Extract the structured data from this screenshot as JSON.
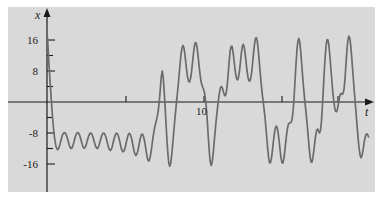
{
  "figure": {
    "background_color": "#ffffff",
    "plot_background_color": "#d9d9d9",
    "curve_color": "#6b6b6b",
    "axis_color": "#1a1a1a"
  },
  "axes": {
    "x_axis_label": "t",
    "y_axis_label": "x",
    "x_tick_labels": [
      "10"
    ],
    "y_tick_labels": [
      "16",
      "8",
      "-8",
      "-16"
    ]
  },
  "chart_data": {
    "type": "line",
    "title": "",
    "subtitle": "",
    "xlabel": "t",
    "ylabel": "x",
    "xlim": [
      0,
      20.6
    ],
    "ylim": [
      -19.5,
      18.5
    ],
    "grid": false,
    "legend_position": "none",
    "xticks": [
      5,
      10,
      15,
      20
    ],
    "xtick_labels": [
      "",
      "10",
      "",
      ""
    ],
    "yticks": [
      -16,
      -12,
      -8,
      -4,
      0,
      4,
      8,
      12,
      16
    ],
    "ytick_labels": [
      "-16",
      "",
      "-8",
      "",
      "",
      "",
      "8",
      "",
      "16"
    ],
    "series": [
      {
        "name": "x(t)",
        "color": "#6b6b6b",
        "x": [
          0.0,
          0.04,
          0.08,
          0.12,
          0.16,
          0.2,
          0.24,
          0.28,
          0.32,
          0.36,
          0.4,
          0.45,
          0.5,
          0.56,
          0.62,
          0.68,
          0.74,
          0.8,
          0.86,
          0.92,
          0.98,
          1.04,
          1.1,
          1.16,
          1.22,
          1.28,
          1.34,
          1.4,
          1.46,
          1.52,
          1.58,
          1.64,
          1.7,
          1.76,
          1.82,
          1.88,
          1.94,
          2.0,
          2.06,
          2.12,
          2.18,
          2.24,
          2.3,
          2.36,
          2.42,
          2.48,
          2.54,
          2.6,
          2.66,
          2.72,
          2.78,
          2.84,
          2.9,
          2.96,
          3.02,
          3.08,
          3.14,
          3.2,
          3.26,
          3.32,
          3.38,
          3.44,
          3.5,
          3.56,
          3.62,
          3.68,
          3.74,
          3.8,
          3.86,
          3.92,
          3.98,
          4.04,
          4.1,
          4.16,
          4.22,
          4.28,
          4.34,
          4.4,
          4.46,
          4.52,
          4.58,
          4.64,
          4.7,
          4.76,
          4.82,
          4.88,
          4.94,
          5.0,
          5.06,
          5.12,
          5.18,
          5.24,
          5.3,
          5.36,
          5.42,
          5.48,
          5.54,
          5.6,
          5.66,
          5.72,
          5.78,
          5.84,
          5.9,
          5.96,
          6.02,
          6.08,
          6.14,
          6.2,
          6.26,
          6.32,
          6.38,
          6.44,
          6.5,
          6.56,
          6.62,
          6.68,
          6.74,
          6.8,
          6.86,
          6.92,
          6.98,
          7.04,
          7.1,
          7.16,
          7.22,
          7.28,
          7.34,
          7.4,
          7.46,
          7.52,
          7.58,
          7.64,
          7.7,
          7.76,
          7.82,
          7.88,
          7.94,
          8.0,
          8.06,
          8.12,
          8.18,
          8.24,
          8.3,
          8.36,
          8.42,
          8.48,
          8.54,
          8.6,
          8.66,
          8.72,
          8.78,
          8.84,
          8.9,
          8.96,
          9.02,
          9.08,
          9.14,
          9.2,
          9.26,
          9.32,
          9.38,
          9.44,
          9.5,
          9.56,
          9.62,
          9.68,
          9.74,
          9.8,
          9.86,
          9.92,
          9.98,
          10.04,
          10.1,
          10.16,
          10.22,
          10.28,
          10.34,
          10.4,
          10.46,
          10.52,
          10.58,
          10.64,
          10.7,
          10.76,
          10.82,
          10.88,
          10.94,
          11.0,
          11.06,
          11.12,
          11.18,
          11.24,
          11.3,
          11.36,
          11.42,
          11.48,
          11.54,
          11.6,
          11.66,
          11.72,
          11.78,
          11.84,
          11.9,
          11.96,
          12.02,
          12.08,
          12.14,
          12.2,
          12.26,
          12.32,
          12.38,
          12.44,
          12.5,
          12.56,
          12.62,
          12.68,
          12.74,
          12.8,
          12.86,
          12.92,
          12.98,
          13.04,
          13.1,
          13.16,
          13.22,
          13.28,
          13.34,
          13.4,
          13.46,
          13.52,
          13.58,
          13.64,
          13.7,
          13.76,
          13.82,
          13.88,
          13.94,
          14.0,
          14.06,
          14.12,
          14.18,
          14.24,
          14.3,
          14.36,
          14.42,
          14.48,
          14.54,
          14.6,
          14.66,
          14.72,
          14.78,
          14.84,
          14.9,
          14.96,
          15.02,
          15.08,
          15.14,
          15.2,
          15.26,
          15.32,
          15.38,
          15.44,
          15.5,
          15.56,
          15.62,
          15.68,
          15.74,
          15.8,
          15.86,
          15.92,
          15.98,
          16.04,
          16.1,
          16.16,
          16.22,
          16.28,
          16.34,
          16.4,
          16.46,
          16.52,
          16.58,
          16.64,
          16.7,
          16.76,
          16.82,
          16.88,
          16.94,
          17.0,
          17.06,
          17.12,
          17.18,
          17.24,
          17.3,
          17.36,
          17.42,
          17.48,
          17.54,
          17.6,
          17.66,
          17.72,
          17.78,
          17.84,
          17.9,
          17.96,
          18.02,
          18.08,
          18.14,
          18.2,
          18.26,
          18.32,
          18.38,
          18.44,
          18.5,
          18.56,
          18.62,
          18.68,
          18.74,
          18.8,
          18.86,
          18.92,
          18.98,
          19.04,
          19.1,
          19.16,
          19.22,
          19.28,
          19.34,
          19.4,
          19.46,
          19.52,
          19.58,
          19.64,
          19.7,
          19.76,
          19.82,
          19.88,
          19.94,
          20.0,
          20.06,
          20.12,
          20.18,
          20.24,
          20.3,
          20.36,
          20.42,
          20.48
        ],
        "y": [
          17.8,
          16.0,
          13.0,
          10.0,
          7.5,
          5.0,
          2.6,
          0.3,
          -2.0,
          -4.2,
          -6.2,
          -8.2,
          -9.8,
          -11.2,
          -12.0,
          -12.3,
          -12.0,
          -11.3,
          -10.4,
          -9.4,
          -8.6,
          -8.1,
          -7.9,
          -8.0,
          -8.4,
          -9.1,
          -10.0,
          -10.9,
          -11.6,
          -12.0,
          -11.9,
          -11.4,
          -10.6,
          -9.6,
          -8.8,
          -8.2,
          -7.9,
          -8.0,
          -8.4,
          -9.1,
          -10.0,
          -10.9,
          -11.6,
          -11.9,
          -11.8,
          -11.2,
          -10.4,
          -9.5,
          -8.7,
          -8.2,
          -8.0,
          -8.2,
          -8.7,
          -9.5,
          -10.4,
          -11.2,
          -11.8,
          -12.0,
          -11.7,
          -11.1,
          -10.2,
          -9.3,
          -8.5,
          -8.1,
          -8.0,
          -8.3,
          -8.9,
          -9.8,
          -10.8,
          -11.7,
          -12.3,
          -12.5,
          -12.2,
          -11.4,
          -10.4,
          -9.4,
          -8.6,
          -8.1,
          -8.1,
          -8.5,
          -9.3,
          -10.3,
          -11.4,
          -12.3,
          -12.8,
          -12.8,
          -12.3,
          -11.4,
          -10.2,
          -9.2,
          -8.4,
          -8.1,
          -8.3,
          -9.0,
          -10.0,
          -11.3,
          -12.5,
          -13.4,
          -13.8,
          -13.5,
          -12.7,
          -11.5,
          -10.2,
          -9.1,
          -8.4,
          -8.3,
          -8.8,
          -9.8,
          -11.2,
          -12.8,
          -14.2,
          -15.1,
          -15.2,
          -14.5,
          -13.1,
          -11.3,
          -9.5,
          -7.9,
          -6.6,
          -5.5,
          -4.5,
          -3.4,
          -1.8,
          0.5,
          3.5,
          6.5,
          8.0,
          6.5,
          3.0,
          -1.0,
          -5.5,
          -9.8,
          -13.4,
          -15.8,
          -16.6,
          -15.8,
          -13.8,
          -11.2,
          -8.4,
          -5.6,
          -3.0,
          -0.4,
          2.0,
          4.5,
          7.2,
          10.0,
          12.4,
          14.0,
          14.6,
          14.0,
          12.4,
          10.2,
          8.0,
          6.3,
          5.3,
          5.2,
          6.0,
          7.6,
          9.8,
          12.2,
          14.2,
          15.3,
          15.2,
          14.0,
          12.0,
          9.6,
          7.4,
          5.6,
          4.5,
          3.8,
          3.2,
          2.2,
          0.5,
          -2.0,
          -5.5,
          -9.5,
          -13.0,
          -15.5,
          -16.4,
          -15.6,
          -13.5,
          -10.8,
          -8.0,
          -5.4,
          -3.0,
          -0.8,
          1.2,
          2.8,
          3.8,
          4.0,
          3.5,
          2.6,
          1.8,
          1.6,
          2.4,
          4.4,
          7.2,
          10.3,
          12.9,
          14.3,
          14.4,
          13.2,
          11.2,
          9.0,
          7.2,
          6.0,
          5.7,
          6.4,
          8.0,
          10.3,
          12.6,
          14.3,
          14.9,
          14.2,
          12.5,
          10.3,
          8.1,
          6.4,
          5.5,
          5.4,
          6.2,
          7.8,
          10.2,
          12.8,
          15.0,
          16.4,
          16.6,
          15.5,
          13.3,
          10.5,
          7.5,
          4.8,
          2.4,
          0.4,
          -1.6,
          -3.8,
          -6.4,
          -9.3,
          -12.2,
          -14.5,
          -15.7,
          -15.6,
          -14.4,
          -12.4,
          -10.2,
          -8.2,
          -6.8,
          -6.2,
          -6.6,
          -7.9,
          -9.9,
          -12.2,
          -14.3,
          -15.6,
          -15.8,
          -14.8,
          -12.9,
          -10.6,
          -8.4,
          -6.7,
          -5.7,
          -5.4,
          -5.4,
          -5.2,
          -4.2,
          -2.0,
          1.4,
          5.6,
          9.8,
          13.4,
          15.7,
          16.4,
          15.4,
          13.1,
          10.0,
          6.8,
          3.8,
          1.2,
          -1.2,
          -3.6,
          -6.2,
          -9.0,
          -11.9,
          -14.2,
          -15.5,
          -15.5,
          -14.3,
          -12.4,
          -10.3,
          -8.5,
          -7.3,
          -7.0,
          -7.5,
          -8.0,
          -7.3,
          -5.0,
          -1.2,
          3.2,
          7.8,
          11.8,
          14.7,
          16.1,
          16.0,
          14.4,
          11.8,
          8.7,
          5.6,
          2.8,
          0.4,
          -1.4,
          -2.4,
          -2.5,
          -1.8,
          -0.5,
          1.0,
          2.0,
          2.2,
          2.0,
          2.2,
          3.4,
          6.0,
          9.6,
          13.2,
          15.8,
          17.0,
          16.6,
          14.8,
          12.0,
          8.8,
          5.5,
          2.4,
          -0.6,
          -3.6,
          -6.6,
          -9.5,
          -12.0,
          -13.7,
          -14.4,
          -13.9,
          -12.6,
          -11.0,
          -9.6,
          -8.6,
          -8.2,
          -8.4,
          -9.0
        ]
      }
    ]
  }
}
